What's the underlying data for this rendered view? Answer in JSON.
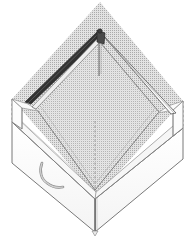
{
  "figure": {
    "type": "technical-illustration",
    "caption": "",
    "background_color": "#ffffff",
    "canvas": {
      "width": 190,
      "height": 249
    }
  },
  "style": {
    "outline_color": "#555555",
    "light_line_color": "#9a9a9a",
    "dark_rail_color": "#3a3a3a",
    "hatch_color": "#9d9d9d",
    "hatch_fill": "#d8d8d8",
    "panel_fill": "#fdfdfd",
    "panel_shade": "#f2f2f2",
    "dashed_color": "#8e8e8e",
    "handle_color": "#8c8c8c"
  },
  "parts": {
    "hatched_floor": {
      "name": "hatched interior floor",
      "pattern": "fine cross-hatch screen",
      "shape": "diamond"
    },
    "back_left_rail": {
      "name": "dark diagonal back-left rail",
      "shade": "dark"
    },
    "back_right_rail": {
      "name": "back-right rail",
      "shade": "light"
    },
    "corner_post": {
      "name": "back corner post",
      "position": "rear apex"
    },
    "front_left_panel": {
      "name": "front-left wall panel"
    },
    "front_right_panel": {
      "name": "front-right wall panel"
    },
    "handle": {
      "name": "curved hook handle",
      "shape": "J-curve"
    },
    "construction_lines": {
      "name": "dashed construction lines",
      "style": "dashed",
      "count": 3
    }
  },
  "annotations": {
    "left_dashed_label": "",
    "right_dashed_label": "",
    "center_dashed_label": ""
  }
}
